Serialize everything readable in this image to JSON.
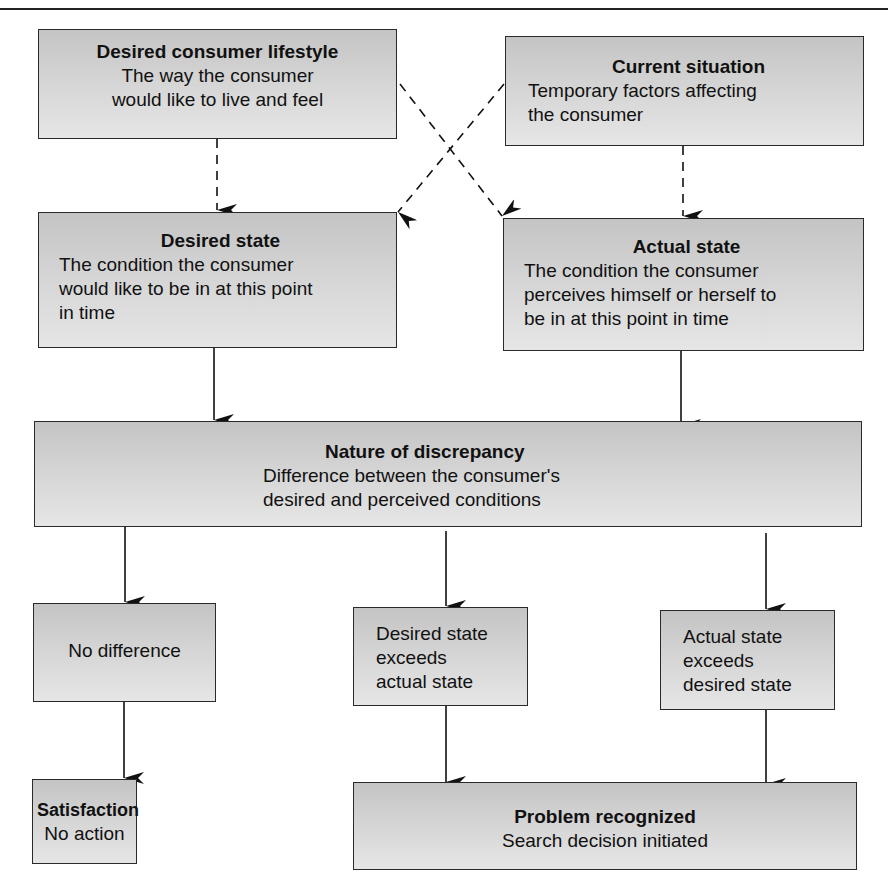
{
  "diagram": {
    "title_rule": true,
    "nodes": {
      "lifestyle": {
        "title": "Desired consumer lifestyle",
        "desc_lines": [
          "The way the consumer",
          "would like to live and feel"
        ]
      },
      "situation": {
        "title": "Current situation",
        "desc_lines": [
          "Temporary factors affecting",
          "the consumer"
        ]
      },
      "desired_state": {
        "title": "Desired state",
        "desc_lines": [
          "The condition the consumer",
          "would like to be in at this point",
          "in time"
        ]
      },
      "actual_state": {
        "title": "Actual state",
        "desc_lines": [
          "The condition the consumer",
          "perceives himself or herself to",
          "be in at this point in time"
        ]
      },
      "discrepancy": {
        "title": "Nature of discrepancy",
        "desc_lines": [
          "Difference between the consumer's",
          "desired and perceived conditions"
        ]
      },
      "no_difference": {
        "desc_lines": [
          "No difference"
        ]
      },
      "desired_exceeds": {
        "desc_lines": [
          "Desired state",
          "exceeds",
          "actual state"
        ]
      },
      "actual_exceeds": {
        "desc_lines": [
          "Actual state",
          "exceeds",
          "desired state"
        ]
      },
      "satisfaction": {
        "title": "Satisfaction",
        "desc_lines": [
          "No action"
        ]
      },
      "problem": {
        "title": "Problem recognized",
        "desc_lines": [
          "Search decision initiated"
        ]
      }
    },
    "edges": [
      {
        "from": "lifestyle",
        "to": "desired_state",
        "style": "dashed"
      },
      {
        "from": "lifestyle",
        "to": "actual_state",
        "style": "dashed"
      },
      {
        "from": "situation",
        "to": "desired_state",
        "style": "dashed"
      },
      {
        "from": "situation",
        "to": "actual_state",
        "style": "dashed"
      },
      {
        "from": "desired_state",
        "to": "discrepancy",
        "style": "solid"
      },
      {
        "from": "actual_state",
        "to": "discrepancy",
        "style": "solid"
      },
      {
        "from": "discrepancy",
        "to": "no_difference",
        "style": "solid"
      },
      {
        "from": "discrepancy",
        "to": "desired_exceeds",
        "style": "solid"
      },
      {
        "from": "discrepancy",
        "to": "actual_exceeds",
        "style": "solid"
      },
      {
        "from": "no_difference",
        "to": "satisfaction",
        "style": "solid"
      },
      {
        "from": "desired_exceeds",
        "to": "problem",
        "style": "solid"
      },
      {
        "from": "actual_exceeds",
        "to": "problem",
        "style": "solid"
      }
    ],
    "colors": {
      "box_fill_top": "#c4c4c4",
      "box_fill_bottom": "#e6e6e6",
      "border": "#2a2a2a",
      "line": "#111111"
    }
  }
}
